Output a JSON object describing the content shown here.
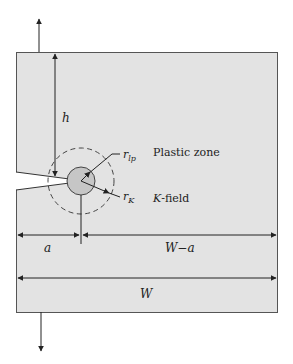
{
  "figure": {
    "colors": {
      "specimen_fill": "#e3e3e3",
      "specimen_stroke": "#555555",
      "plastic_zone_fill": "#c6c6c6",
      "line": "#222222",
      "background": "#ffffff"
    },
    "labels": {
      "h": "h",
      "r_lp": "r",
      "r_lp_sub": "lp",
      "r_K": "r",
      "r_K_sub": "K",
      "plastic_zone": "Plastic zone",
      "k_field_italic": "K",
      "k_field_rest": "-field",
      "a": "a",
      "w_minus_a": "W−a",
      "w": "W"
    }
  }
}
